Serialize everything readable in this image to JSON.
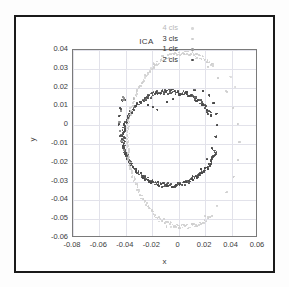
{
  "figure": {
    "title": "ICA",
    "xlabel": "x",
    "ylabel": "y"
  },
  "legend": {
    "position": "top-right-inside",
    "entries": [
      {
        "label": "4 cls",
        "color": "#d8d8d8",
        "marker": "dot"
      },
      {
        "label": "3 cls",
        "color": "#cfcfcf",
        "marker": "dot"
      },
      {
        "label": "1 cls",
        "color": "#9a9a9a",
        "marker": "dot"
      },
      {
        "label": "2 cls",
        "color": "#4a4a4a",
        "marker": "dot"
      }
    ]
  },
  "axes": {
    "x_ticks": [
      "-0.08",
      "-0.06",
      "-0.04",
      "-0.02",
      "0",
      "0.02",
      "0.04",
      "0.06"
    ],
    "y_ticks": [
      "0.04",
      "0.03",
      "0.02",
      "0.01",
      "0",
      "-0.01",
      "-0.02",
      "-0.03",
      "-0.04",
      "-0.05",
      "-0.06"
    ],
    "xlim": [
      -0.08,
      0.06
    ],
    "ylim": [
      -0.06,
      0.04
    ],
    "grid": true
  },
  "chart_data": {
    "type": "scatter",
    "title": "ICA",
    "xlabel": "x",
    "ylabel": "y",
    "xlim": [
      -0.08,
      0.06
    ],
    "ylim": [
      -0.06,
      0.04
    ],
    "grid": true,
    "legend_position": "upper right",
    "xtick_labels": [
      "-0.08",
      "-0.06",
      "-0.04",
      "-0.02",
      "0",
      "0.02",
      "0.04",
      "0.06"
    ],
    "ytick_labels": [
      "0.04",
      "0.03",
      "0.02",
      "0.01",
      "0",
      "-0.01",
      "-0.02",
      "-0.03",
      "-0.04",
      "-0.05",
      "-0.06"
    ],
    "series": [
      {
        "name": "2 cls",
        "color": "#4a4a4a",
        "marker_size": 1.7,
        "shape": "inner-ring",
        "n_points": 420,
        "center": [
          -0.0065,
          -0.007
        ],
        "radius_x": 0.0355,
        "radius_y": 0.025,
        "angle_start_deg": 28,
        "angle_end_deg": 345,
        "radial_jitter": 0.0013,
        "points": [
          [
            -0.0161,
            0.0081
          ],
          [
            -0.0195,
            0.0097
          ],
          [
            -0.023,
            0.011
          ],
          [
            -0.034,
            0.014
          ],
          [
            -0.0405,
            0.0137
          ],
          [
            -0.0425,
            0.013
          ],
          [
            -0.044,
            0.009
          ],
          [
            -0.0448,
            0.005
          ],
          [
            -0.0452,
            0.0005
          ],
          [
            -0.044,
            -0.0055
          ],
          [
            -0.042,
            -0.011
          ],
          [
            -0.0395,
            -0.016
          ],
          [
            -0.036,
            -0.0205
          ],
          [
            -0.032,
            -0.0245
          ],
          [
            -0.027,
            -0.028
          ],
          [
            -0.0215,
            -0.0305
          ],
          [
            -0.0155,
            -0.0318
          ],
          [
            -0.009,
            -0.0322
          ],
          [
            -0.0025,
            -0.0318
          ],
          [
            0.004,
            -0.03
          ],
          [
            0.0105,
            -0.0272
          ],
          [
            0.0165,
            -0.0232
          ],
          [
            0.0215,
            -0.0182
          ],
          [
            0.0255,
            -0.0125
          ],
          [
            0.028,
            -0.0062
          ],
          [
            0.0292,
            0.0
          ],
          [
            0.0288,
            0.0062
          ],
          [
            0.0268,
            0.0118
          ],
          [
            0.0232,
            0.016
          ],
          [
            0.0182,
            0.0182
          ],
          [
            0.0122,
            0.0185
          ],
          [
            0.0062,
            0.0175
          ],
          [
            0.0008,
            0.0158
          ],
          [
            -0.0042,
            0.014
          ],
          [
            -0.009,
            0.0122
          ]
        ]
      },
      {
        "name": "1 cls",
        "color": "#8f8f8f",
        "marker_size": 1.7,
        "shape": "sparse-left-arc",
        "n_points": 22,
        "points": [
          [
            -0.0415,
            0.0145
          ],
          [
            -0.042,
            0.0135
          ],
          [
            -0.0438,
            0.0072
          ],
          [
            -0.0448,
            0.002
          ],
          [
            -0.0444,
            -0.0032
          ],
          [
            -0.0432,
            -0.0085
          ],
          [
            -0.0412,
            -0.0132
          ],
          [
            -0.0388,
            -0.0172
          ]
        ]
      },
      {
        "name": "3 cls",
        "color": "#cfcfcf",
        "marker_size": 1.6,
        "shape": "outer-arc",
        "n_points": 260,
        "center": [
          0.004,
          -0.0078
        ],
        "radius_x": 0.0425,
        "radius_y": 0.0462,
        "angle_start_deg": 58,
        "angle_end_deg": 300,
        "radial_jitter": 0.0011,
        "points": [
          [
            -0.019,
            0.033
          ],
          [
            -0.012,
            0.0368
          ],
          [
            -0.004,
            0.0382
          ],
          [
            0.0045,
            0.0378
          ],
          [
            0.0135,
            0.0355
          ],
          [
            0.0218,
            0.0312
          ],
          [
            0.03,
            0.0252
          ],
          [
            0.0365,
            0.018
          ],
          [
            0.0415,
            0.0095
          ],
          [
            0.0445,
            0.0005
          ],
          [
            0.0458,
            -0.009
          ],
          [
            0.0448,
            -0.0185
          ],
          [
            0.0415,
            -0.0275
          ],
          [
            0.0362,
            -0.0358
          ],
          [
            0.029,
            -0.0428
          ],
          [
            0.0202,
            -0.0486
          ],
          [
            0.0105,
            -0.0524
          ],
          [
            0.0005,
            -0.0542
          ],
          [
            -0.0092,
            -0.054
          ]
        ]
      },
      {
        "name": "4 cls",
        "color": "#dcdcdc",
        "marker_size": 1.6,
        "shape": "outer-arc-tail",
        "n_points": 40,
        "points": [
          [
            -0.0215,
            0.03
          ],
          [
            -0.0255,
            0.0255
          ],
          [
            0.043,
            0.0202
          ],
          [
            0.0395,
            0.0255
          ],
          [
            -0.015,
            -0.0512
          ],
          [
            -0.006,
            -0.054
          ]
        ]
      }
    ]
  }
}
